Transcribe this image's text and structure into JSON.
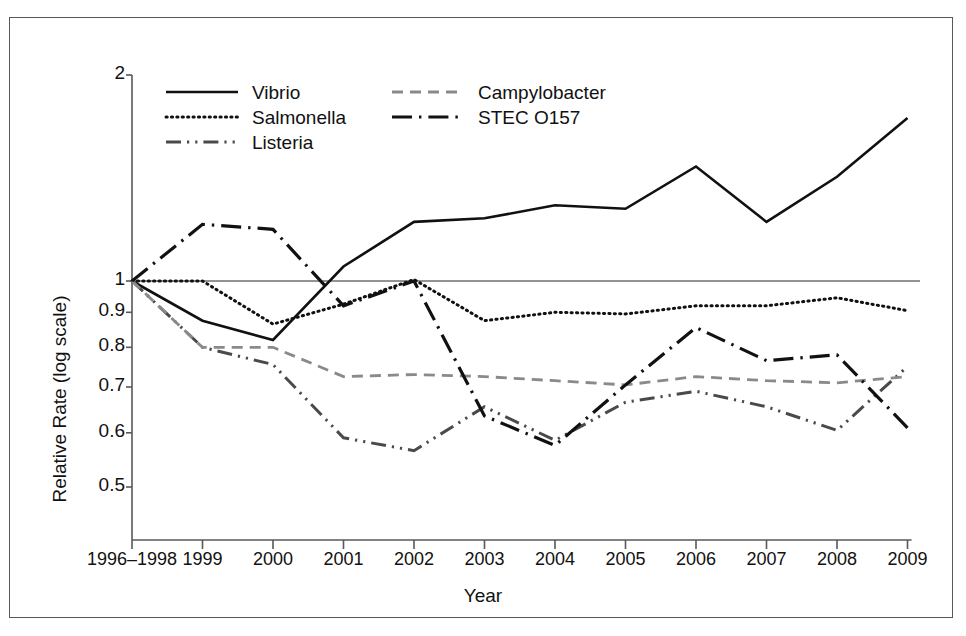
{
  "chart_data": {
    "type": "line",
    "title": "",
    "xlabel": "Year",
    "ylabel": "Relative Rate (log scale)",
    "categories": [
      "1996–1998",
      "1999",
      "2000",
      "2001",
      "2002",
      "2003",
      "2004",
      "2005",
      "2006",
      "2007",
      "2008",
      "2009"
    ],
    "yscale": "log",
    "ylim": [
      0.45,
      2.0
    ],
    "yticks": [
      "2",
      "1",
      "0.9",
      "0.8",
      "0.7",
      "0.6",
      "0.5"
    ],
    "ytick_values": [
      2,
      1,
      0.9,
      0.8,
      0.7,
      0.6,
      0.5
    ],
    "grid": false,
    "reference_line": 1.0,
    "legend_position": "top-left-inside",
    "series": [
      {
        "name": "Vibrio",
        "style": "solid",
        "color": "#111111",
        "values": [
          1.0,
          0.875,
          0.82,
          1.05,
          1.22,
          1.235,
          1.29,
          1.275,
          1.47,
          1.22,
          1.42,
          1.73
        ]
      },
      {
        "name": "Salmonella",
        "style": "dotted",
        "color": "#111111",
        "values": [
          1.0,
          1.0,
          0.865,
          0.925,
          1.005,
          0.875,
          0.9,
          0.895,
          0.92,
          0.92,
          0.945,
          0.905
        ]
      },
      {
        "name": "Listeria",
        "style": "dash-dot-dot",
        "color": "#4a4a4a",
        "values": [
          1.0,
          0.8,
          0.755,
          0.59,
          0.565,
          0.655,
          0.585,
          0.665,
          0.69,
          0.655,
          0.605,
          0.75
        ]
      },
      {
        "name": "Campylobacter",
        "style": "dashed",
        "color": "#8a8a8a",
        "values": [
          1.0,
          0.8,
          0.8,
          0.725,
          0.73,
          0.725,
          0.715,
          0.705,
          0.725,
          0.715,
          0.71,
          0.725
        ]
      },
      {
        "name": "STEC O157",
        "style": "dash-dot",
        "color": "#111111",
        "values": [
          1.0,
          1.21,
          1.19,
          0.92,
          1.0,
          0.635,
          0.575,
          0.705,
          0.855,
          0.765,
          0.78,
          0.61
        ]
      }
    ]
  },
  "legend": {
    "items": [
      {
        "label": "Vibrio"
      },
      {
        "label": "Campylobacter"
      },
      {
        "label": "Salmonella"
      },
      {
        "label": "STEC O157"
      },
      {
        "label": "Listeria"
      }
    ]
  }
}
